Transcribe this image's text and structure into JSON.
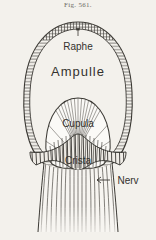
{
  "figure": {
    "caption": "Fig. 561.",
    "background_color": "#f3f1ec",
    "ink_color": "#3b3934",
    "labels": {
      "raphe": "Raphe",
      "ampulla": "Ampulle",
      "cupula": "Cupula",
      "crista": "Crista",
      "nerve": "Nerv"
    },
    "structures": [
      "ampulla-wall",
      "raphe-band",
      "cupula-dome",
      "crista-base",
      "nerve-stalk"
    ]
  }
}
